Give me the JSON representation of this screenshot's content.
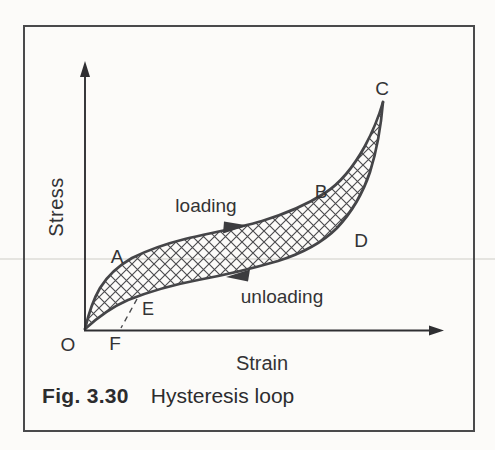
{
  "figure": {
    "caption": {
      "label": "Fig. 3.30",
      "title": "Hysteresis loop"
    },
    "axes": {
      "y_label": "Stress",
      "x_label": "Strain"
    },
    "annotations": {
      "loading": "loading",
      "unloading": "unloading"
    },
    "point_labels": {
      "origin": "O",
      "a": "A",
      "b": "B",
      "c": "C",
      "d": "D",
      "e": "E",
      "f": "F"
    },
    "colors": {
      "ink": "#333335",
      "curve": "#454548",
      "hatch": "#4b4b4e",
      "axis": "#2f2f32",
      "frame_border": "#4a4a4c",
      "background": "#fcfbf9"
    }
  },
  "geometry": {
    "loading_path": "M 85,329 C 89,312 93,300 100,288 C 108,275 118,266 132,258 C 148,250 165,244 185,239 C 210,233 235,229 262,221 C 288,213 308,204 325,193 C 342,182 354,166 365,146 C 373,131 379,116 383,102",
    "unloading_path": "M 383,102 C 381,126 377,150 370,172 C 363,193 352,212 337,228 C 320,245 300,254 278,261 C 254,268 225,275 198,280 C 172,285 148,292 128,300 C 112,307 97,318 85,329",
    "region_path": "M 85,329 C 89,312 93,300 100,288 C 108,275 118,266 132,258 C 148,250 165,244 185,239 C 210,233 235,229 262,221 C 288,213 308,204 325,193 C 342,182 354,166 365,146 C 373,131 379,116 383,102 C 381,126 377,150 370,172 C 363,193 352,212 337,228 C 320,245 300,254 278,261 C 254,268 225,275 198,280 C 172,285 148,292 128,300 C 112,307 97,318 85,329 Z",
    "dashed_ef_path": "M 137,299 L 121,328",
    "y_axis_path": "M 85,331 L 85,75",
    "x_axis_path": "M 84,330.5 L 430,330.5",
    "y_axis_arrow_points": "85,61 80,77 90,77",
    "x_axis_arrow_points": "444,330.5 429,325.5 429,335.5",
    "loading_arrow_points": "248,225.5 224,221.5 223,233.5",
    "unloading_arrow_points": "226,277 250,269.5 248,281.5"
  }
}
